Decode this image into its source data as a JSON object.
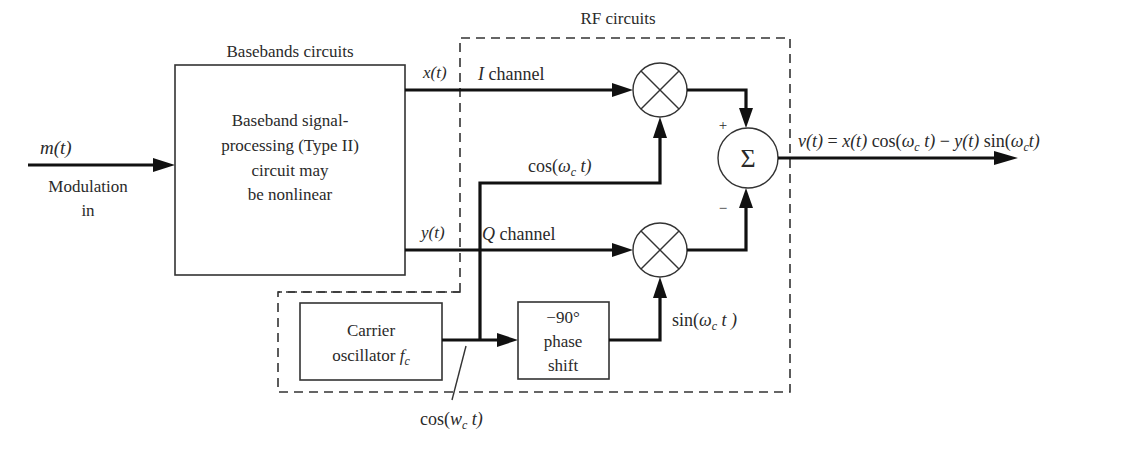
{
  "diagram": {
    "title_baseband": "Basebands circuits",
    "title_rf": "RF circuits",
    "input": {
      "signal": "m(t)",
      "label_line1": "Modulation",
      "label_line2": "in"
    },
    "baseband_block": {
      "lines": [
        "Baseband signal-",
        "processing (Type II)",
        "circuit may",
        "be nonlinear"
      ]
    },
    "i_path": {
      "signal": "x(t)",
      "channel_label_var": "I",
      "channel_label_word": " channel"
    },
    "q_path": {
      "signal": "y(t)",
      "channel_label_var": "Q",
      "channel_label_word": " channel"
    },
    "carrier_block": {
      "line1": "Carrier",
      "line2": "oscillator ",
      "line2_var": "f",
      "line2_sub": "c"
    },
    "phase_block": {
      "lines": [
        "−90°",
        "phase",
        "shift"
      ]
    },
    "cos_label": {
      "pre": "cos(",
      "var": "ω",
      "sub": "c",
      "post": " t)"
    },
    "cos_note": {
      "pre": "cos(",
      "var": "w",
      "sub": "c",
      "post": " t)"
    },
    "sin_label": {
      "pre": "sin(",
      "var": "ω",
      "sub": "c",
      "post": " t )"
    },
    "summer": {
      "symbol": "Σ",
      "plus": "+",
      "minus": "−"
    },
    "output": {
      "v": "v(t)",
      "eq": " = ",
      "x": "x(t)",
      "cos_pre": " cos(",
      "w1": "ω",
      "c1": "c",
      "t1": " t)",
      "minus": " − ",
      "y": "y(t)",
      "sin_pre": " sin(",
      "w2": "ω",
      "c2": "c",
      "t2": "t)"
    },
    "colors": {
      "line": "#111111",
      "text": "#2a2a2a",
      "background": "#ffffff"
    }
  }
}
